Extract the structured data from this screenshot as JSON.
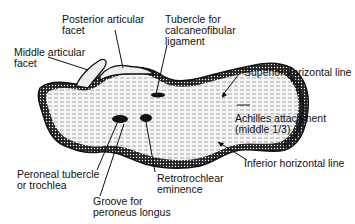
{
  "figure": {
    "colors": {
      "ink": "#111111",
      "background": "#ffffff",
      "bone_fill": "#f4f4f4"
    }
  },
  "labels": {
    "posterior_articular_facet": {
      "line1": "Posterior articular",
      "line2": "facet"
    },
    "middle_articular_facet": {
      "line1": "Middle articular",
      "line2": "facet"
    },
    "tubercle_calcaneofibular": {
      "line1": "Tubercle for",
      "line2": "calcaneofibular",
      "line3": "ligament"
    },
    "superior_horizontal_line": {
      "line1": "Superior horizontal line"
    },
    "achilles_attachment": {
      "line1": "Achilles attachment",
      "line2": "(middle 1/3)"
    },
    "inferior_horizontal_line": {
      "line1": "Inferior horizontal line"
    },
    "peroneal_tubercle": {
      "line1": "Peroneal tubercle",
      "line2": "or trochlea"
    },
    "retrotrochlear_eminence": {
      "line1": "Retrotrochlear",
      "line2": "eminence"
    },
    "groove_peroneus_longus": {
      "line1": "Groove for",
      "line2": "peroneus longus"
    }
  }
}
